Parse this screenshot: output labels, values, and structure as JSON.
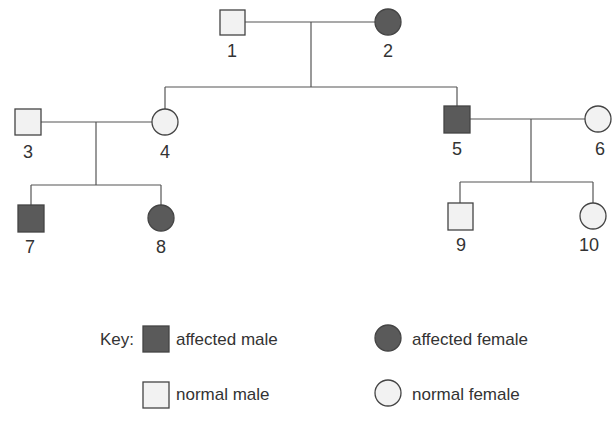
{
  "colors": {
    "affected": "#5a5a5a",
    "normal": "#f2f2f2",
    "stroke": "#444444",
    "line": "#555555",
    "text": "#333333"
  },
  "individuals": [
    {
      "id": "1",
      "label": "1",
      "sex": "male",
      "affected": false,
      "generation": 1
    },
    {
      "id": "2",
      "label": "2",
      "sex": "female",
      "affected": true,
      "generation": 1
    },
    {
      "id": "3",
      "label": "3",
      "sex": "male",
      "affected": false,
      "generation": 2
    },
    {
      "id": "4",
      "label": "4",
      "sex": "female",
      "affected": false,
      "generation": 2
    },
    {
      "id": "5",
      "label": "5",
      "sex": "male",
      "affected": true,
      "generation": 2
    },
    {
      "id": "6",
      "label": "6",
      "sex": "female",
      "affected": false,
      "generation": 2
    },
    {
      "id": "7",
      "label": "7",
      "sex": "male",
      "affected": true,
      "generation": 3
    },
    {
      "id": "8",
      "label": "8",
      "sex": "female",
      "affected": true,
      "generation": 3
    },
    {
      "id": "9",
      "label": "9",
      "sex": "male",
      "affected": false,
      "generation": 3
    },
    {
      "id": "10",
      "label": "10",
      "sex": "female",
      "affected": false,
      "generation": 3
    }
  ],
  "relationships": {
    "matings": [
      [
        "1",
        "2"
      ],
      [
        "3",
        "4"
      ],
      [
        "5",
        "6"
      ]
    ],
    "offspring": [
      {
        "parents": [
          "1",
          "2"
        ],
        "children": [
          "4",
          "5"
        ]
      },
      {
        "parents": [
          "3",
          "4"
        ],
        "children": [
          "7",
          "8"
        ]
      },
      {
        "parents": [
          "5",
          "6"
        ],
        "children": [
          "9",
          "10"
        ]
      }
    ]
  },
  "key": {
    "title": "Key:",
    "items": [
      {
        "label": "affected male",
        "sex": "male",
        "affected": true
      },
      {
        "label": "affected female",
        "sex": "female",
        "affected": true
      },
      {
        "label": "normal male",
        "sex": "male",
        "affected": false
      },
      {
        "label": "normal female",
        "sex": "female",
        "affected": false
      }
    ]
  }
}
